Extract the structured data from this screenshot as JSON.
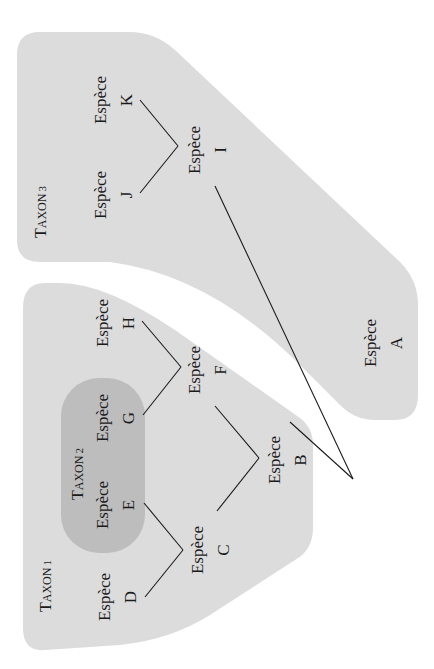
{
  "figure": {
    "orientation": "rotated-90-ccw",
    "colors": {
      "background": "#ffffff",
      "taxon_fill": "#dcdcdc",
      "taxon_nested_fill": "#bdbdbd",
      "line": "#1a1a1a",
      "text": "#1a1a1a"
    },
    "taxa": [
      {
        "id": "taxon1",
        "cap": "T",
        "rest": "AXON",
        "num": "1"
      },
      {
        "id": "taxon2",
        "cap": "T",
        "rest": "AXON",
        "num": "2"
      },
      {
        "id": "taxon3",
        "cap": "T",
        "rest": "AXON",
        "num": "3"
      }
    ],
    "species": [
      {
        "id": "A",
        "word": "Espèce",
        "letter": "A"
      },
      {
        "id": "B",
        "word": "Espèce",
        "letter": "B"
      },
      {
        "id": "C",
        "word": "Espèce",
        "letter": "C"
      },
      {
        "id": "D",
        "word": "Espèce",
        "letter": "D"
      },
      {
        "id": "E",
        "word": "Espèce",
        "letter": "E"
      },
      {
        "id": "F",
        "word": "Espèce",
        "letter": "F"
      },
      {
        "id": "G",
        "word": "Espèce",
        "letter": "G"
      },
      {
        "id": "H",
        "word": "Espèce",
        "letter": "H"
      },
      {
        "id": "I",
        "word": "Espèce",
        "letter": "I"
      },
      {
        "id": "J",
        "word": "Espèce",
        "letter": "J"
      },
      {
        "id": "K",
        "word": "Espèce",
        "letter": "K"
      }
    ],
    "tree": {
      "root": "A",
      "edges": [
        [
          "A",
          "B"
        ],
        [
          "A",
          "I"
        ],
        [
          "B",
          "C"
        ],
        [
          "B",
          "F"
        ],
        [
          "C",
          "D"
        ],
        [
          "C",
          "E"
        ],
        [
          "F",
          "G"
        ],
        [
          "F",
          "H"
        ],
        [
          "I",
          "J"
        ],
        [
          "I",
          "K"
        ]
      ],
      "groups": {
        "taxon1": [
          "B",
          "C",
          "D",
          "E",
          "F",
          "G",
          "H"
        ],
        "taxon2": [
          "E",
          "G"
        ],
        "taxon3": [
          "A",
          "I",
          "J",
          "K"
        ]
      }
    }
  }
}
